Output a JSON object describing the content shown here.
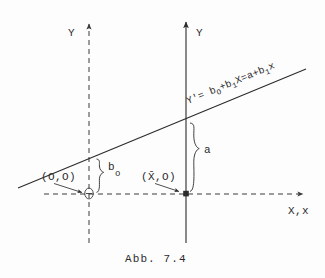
{
  "figure": {
    "caption": "Abb. 7.4",
    "axes": {
      "y_left_label": "Y",
      "y_right_label": "Y",
      "x_label": "X,x"
    },
    "line": {
      "equation": "Y'= b",
      "equation_sub1": "O",
      "equation_mid": "+b",
      "equation_sub2": "1",
      "equation_mid2": "X=a+b",
      "equation_sub3": "1",
      "equation_end": "x",
      "equation_full": "Y'= b_O+b_1X=a+b_1x"
    },
    "annotations": {
      "origin_point_label": "(O,O)",
      "mean_point_label": "(X̄,O)",
      "intercept_label": "b",
      "intercept_subscript": "o",
      "a_label": "a"
    },
    "colors": {
      "ink": "#2b2b2b",
      "paper": "#fdfdfd",
      "guide": "#3a3a3a"
    }
  }
}
